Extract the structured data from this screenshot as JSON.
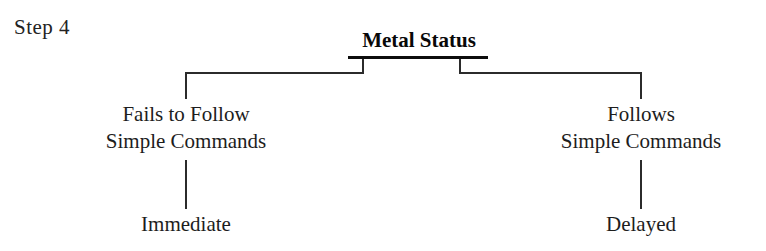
{
  "diagram": {
    "step_label": "Step 4",
    "root": {
      "label": "Metal Status"
    },
    "branches": [
      {
        "side": "left",
        "line1": "Fails to Follow",
        "line2": "Simple Commands",
        "leaf": "Immediate"
      },
      {
        "side": "right",
        "line1": "Follows",
        "line2": "Simple Commands",
        "leaf": "Delayed"
      }
    ],
    "colors": {
      "background": "#ffffff",
      "text": "#1d1d1d",
      "root_text": "#080808",
      "connector": "#2b2b2b"
    }
  }
}
